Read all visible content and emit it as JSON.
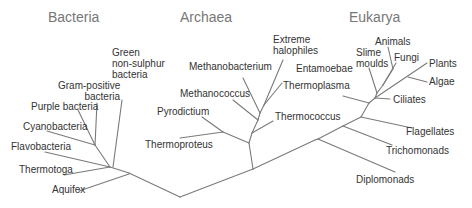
{
  "domains": [
    {
      "name": "Bacteria",
      "x": 48,
      "y": 10
    },
    {
      "name": "Archaea",
      "x": 180,
      "y": 10
    },
    {
      "name": "Eukarya",
      "x": 349,
      "y": 10
    }
  ],
  "taxa": {
    "bacteria": [
      {
        "id": "green-non-sulphur-bacteria",
        "label": "Green\nnon-sulphur\nbacteria"
      },
      {
        "id": "gram-positive-bacteria",
        "label": "Gram-positive\nbacteria"
      },
      {
        "id": "purple-bacteria",
        "label": "Purple bacteria"
      },
      {
        "id": "cyanobacteria",
        "label": "Cyanobacteria"
      },
      {
        "id": "flavobacteria",
        "label": "Flavobacteria"
      },
      {
        "id": "thermotoga",
        "label": "Thermotoga"
      },
      {
        "id": "aquifex",
        "label": "Aquifex"
      }
    ],
    "archaea": [
      {
        "id": "extreme-halophiles",
        "label": "Extreme\nhalophiles"
      },
      {
        "id": "methanobacterium",
        "label": "Methanobacterium"
      },
      {
        "id": "methanococcus",
        "label": "Methanococcus"
      },
      {
        "id": "thermoplasma",
        "label": "Thermoplasma"
      },
      {
        "id": "thermococcus",
        "label": "Thermococcus"
      },
      {
        "id": "pyrodictium",
        "label": "Pyrodictium"
      },
      {
        "id": "thermoproteus",
        "label": "Thermoproteus"
      }
    ],
    "eukarya": [
      {
        "id": "entamoebae",
        "label": "Entamoebae"
      },
      {
        "id": "slime-moulds",
        "label": "Slime\nmoulds"
      },
      {
        "id": "animals",
        "label": "Animals"
      },
      {
        "id": "fungi",
        "label": "Fungi"
      },
      {
        "id": "plants",
        "label": "Plants"
      },
      {
        "id": "algae",
        "label": "Algae"
      },
      {
        "id": "ciliates",
        "label": "Ciliates"
      },
      {
        "id": "flagellates",
        "label": "Flagellates"
      },
      {
        "id": "trichomonads",
        "label": "Trichomonads"
      },
      {
        "id": "diplomonads",
        "label": "Diplomonads"
      }
    ]
  },
  "branches": [
    [
      129,
      173,
      180,
      197
    ],
    [
      180,
      197,
      253,
      169
    ],
    [
      253,
      169,
      315,
      140
    ],
    [
      315,
      140,
      318,
      139
    ],
    [
      110,
      167,
      129,
      173
    ],
    [
      79,
      191,
      129,
      174
    ],
    [
      64,
      175,
      110,
      167
    ],
    [
      45,
      152,
      110,
      167
    ],
    [
      95,
      145,
      110,
      167
    ],
    [
      47,
      131,
      95,
      145
    ],
    [
      78,
      110,
      95,
      145
    ],
    [
      97,
      103,
      95,
      145
    ],
    [
      122,
      100,
      113,
      167
    ],
    [
      253,
      169,
      249,
      143
    ],
    [
      249,
      143,
      223,
      132
    ],
    [
      223,
      132,
      202,
      117
    ],
    [
      223,
      132,
      180,
      138
    ],
    [
      249,
      143,
      252,
      133
    ],
    [
      252,
      133,
      273,
      121
    ],
    [
      252,
      133,
      258,
      120
    ],
    [
      258,
      120,
      233,
      100
    ],
    [
      258,
      120,
      260,
      113
    ],
    [
      260,
      113,
      243,
      78
    ],
    [
      260,
      113,
      264,
      105
    ],
    [
      264,
      105,
      282,
      83
    ],
    [
      264,
      105,
      283,
      60
    ],
    [
      318,
      139,
      395,
      172
    ],
    [
      318,
      139,
      343,
      126
    ],
    [
      343,
      126,
      392,
      145
    ],
    [
      343,
      126,
      361,
      117
    ],
    [
      361,
      117,
      412,
      128
    ],
    [
      361,
      117,
      369,
      103
    ],
    [
      369,
      103,
      343,
      96
    ],
    [
      369,
      103,
      375,
      98
    ],
    [
      375,
      98,
      390,
      99
    ],
    [
      375,
      98,
      377,
      93
    ],
    [
      377,
      93,
      369,
      68
    ],
    [
      377,
      93,
      383,
      85
    ],
    [
      383,
      85,
      393,
      69
    ],
    [
      393,
      69,
      388,
      47
    ],
    [
      383,
      85,
      396,
      63
    ],
    [
      375,
      98,
      427,
      63
    ],
    [
      408,
      77,
      427,
      82
    ]
  ]
}
